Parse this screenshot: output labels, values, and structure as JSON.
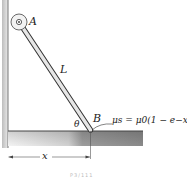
{
  "figure": {
    "labels": {
      "pin": "A",
      "rod_length": "L",
      "angle": "θ",
      "contact": "B",
      "distance": "x"
    },
    "friction_equation": {
      "lhs": "μs",
      "equals": "=",
      "rhs": "μ0(1 − e−x)"
    },
    "caption": "P3/111"
  },
  "colors": {
    "wall": "#9a9a9a",
    "rod_fill": "#e6e6e6",
    "rod_outline": "#333333",
    "ground_top": "#555555",
    "ground_fill_dark": "#8a8a8a",
    "ground_fill_light": "#eeeeee"
  }
}
